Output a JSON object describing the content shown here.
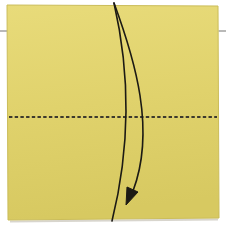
{
  "diagram": {
    "paper_shape": "square sheet",
    "fold_type": "valley fold",
    "fold_line_style": "dashed horizontal line across vertical center",
    "arrow": {
      "style": "curved tapered fold arrow",
      "from": "top edge",
      "to": "bottom edge",
      "head": "solid triangle pointing down-left near bottom"
    },
    "margin_marks": "short gray tick marks at left and right page margins"
  },
  "colors": {
    "background": "#ffffff",
    "paper": "#e0d26c",
    "paper_light": "#e8db7a",
    "paper_dark": "#d7c961",
    "paper_edge": "#cbbd5a",
    "paper_shadow": "#a9a391",
    "fold_line": "#3d3a2d",
    "arrow": "#1c1a14",
    "tick_mark": "#949492"
  }
}
